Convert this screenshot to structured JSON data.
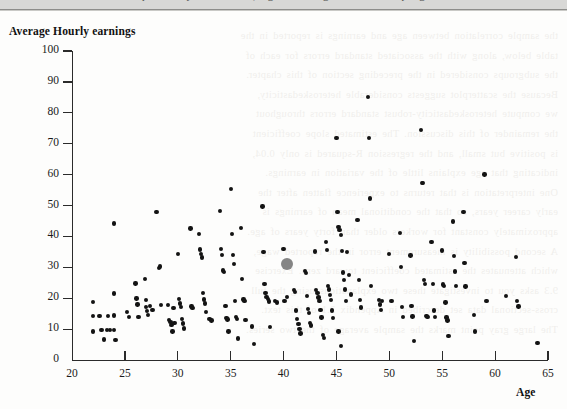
{
  "page": {
    "top_clipped_text": "probability distributions, regression diagnostics and sampling",
    "bleed_lines": [
      "the sample correlation between age and earnings is reported in the",
      "table below, along with the associated standard errors for each of",
      "the subgroups considered in the preceding section of this chapter.",
      "Because the scatterplot suggests considerable heteroskedasticity,",
      "we compute heteroskedasticity-robust standard errors throughout",
      "the remainder of this discussion. The estimated slope coefficient",
      "is positive but small, and the regression R-squared is only 0.04,",
      "indicating that age explains little of the variation in earnings.",
      "One interpretation is that returns to experience flatten after the",
      "early career years, so that the conditional mean of earnings is",
      "approximately constant for workers older than forty years of age.",
      "A second possibility is measurement error in the reported wage,",
      "which attenuates the estimated coefficient toward zero. Exercise",
      "9.3 asks you to investigate these two explanations using the full",
      "cross-sectional data set described in Appendix 3.1 of this text.",
      "The large gray point marks the sample average of the two series."
    ]
  },
  "chart_data": {
    "type": "scatter",
    "title": "",
    "xlabel": "Age",
    "ylabel": "Average Hourly earnings",
    "xlim": [
      20,
      65
    ],
    "ylim": [
      0,
      100
    ],
    "xticks": [
      20,
      25,
      30,
      35,
      40,
      45,
      50,
      55,
      60,
      65
    ],
    "yticks": [
      0,
      10,
      20,
      30,
      40,
      50,
      60,
      70,
      80,
      90,
      100
    ],
    "grid": false,
    "legend": false,
    "point_color": "#131313",
    "highlight_color": "#858585",
    "highlight_point": {
      "x": 40.3,
      "y": 31.0,
      "label": "sample mean"
    },
    "points": [
      [
        22.0,
        18.8
      ],
      [
        22.0,
        14.2
      ],
      [
        22.0,
        9.2
      ],
      [
        22.6,
        14.2
      ],
      [
        22.8,
        9.6
      ],
      [
        23.0,
        6.6
      ],
      [
        23.3,
        9.6
      ],
      [
        23.4,
        14.3
      ],
      [
        23.6,
        9.7
      ],
      [
        24.0,
        44.2
      ],
      [
        24.0,
        21.5
      ],
      [
        24.0,
        14.4
      ],
      [
        24.0,
        9.6
      ],
      [
        24.1,
        6.5
      ],
      [
        25.2,
        15.6
      ],
      [
        25.4,
        13.9
      ],
      [
        26.0,
        24.8
      ],
      [
        26.1,
        19.9
      ],
      [
        26.2,
        18.0
      ],
      [
        26.3,
        14.0
      ],
      [
        26.9,
        26.2
      ],
      [
        27.0,
        19.4
      ],
      [
        27.0,
        17.2
      ],
      [
        27.1,
        15.8
      ],
      [
        27.2,
        14.6
      ],
      [
        27.4,
        17.4
      ],
      [
        27.6,
        16.2
      ],
      [
        28.0,
        47.8
      ],
      [
        28.2,
        29.8
      ],
      [
        28.3,
        30.3
      ],
      [
        28.4,
        17.8
      ],
      [
        29.1,
        17.7
      ],
      [
        29.2,
        13.0
      ],
      [
        29.3,
        12.2
      ],
      [
        29.4,
        11.3
      ],
      [
        29.5,
        9.2
      ],
      [
        29.6,
        16.8
      ],
      [
        29.7,
        12.0
      ],
      [
        30.0,
        34.3
      ],
      [
        30.1,
        19.8
      ],
      [
        30.2,
        18.3
      ],
      [
        30.3,
        17.1
      ],
      [
        30.4,
        13.2
      ],
      [
        30.5,
        11.8
      ],
      [
        30.6,
        10.2
      ],
      [
        31.2,
        42.6
      ],
      [
        31.3,
        17.3
      ],
      [
        31.4,
        16.9
      ],
      [
        32.0,
        40.8
      ],
      [
        32.1,
        35.8
      ],
      [
        32.2,
        34.3
      ],
      [
        32.3,
        33.2
      ],
      [
        32.4,
        21.6
      ],
      [
        32.5,
        19.6
      ],
      [
        32.6,
        18.3
      ],
      [
        32.7,
        15.6
      ],
      [
        33.0,
        13.2
      ],
      [
        33.2,
        12.8
      ],
      [
        34.0,
        48.2
      ],
      [
        34.1,
        36.0
      ],
      [
        34.2,
        34.0
      ],
      [
        34.3,
        29.0
      ],
      [
        34.4,
        28.4
      ],
      [
        34.5,
        17.4
      ],
      [
        34.6,
        13.6
      ],
      [
        34.7,
        13.1
      ],
      [
        34.8,
        9.2
      ],
      [
        35.0,
        55.3
      ],
      [
        35.1,
        40.7
      ],
      [
        35.2,
        34.0
      ],
      [
        35.3,
        31.0
      ],
      [
        35.4,
        19.2
      ],
      [
        35.5,
        14.0
      ],
      [
        35.6,
        13.2
      ],
      [
        35.7,
        7.0
      ],
      [
        36.0,
        42.8
      ],
      [
        36.1,
        26.2
      ],
      [
        36.2,
        19.6
      ],
      [
        36.3,
        19.0
      ],
      [
        36.4,
        13.0
      ],
      [
        37.0,
        10.8
      ],
      [
        37.2,
        5.2
      ],
      [
        38.0,
        49.7
      ],
      [
        38.1,
        35.0
      ],
      [
        38.2,
        24.6
      ],
      [
        38.3,
        21.6
      ],
      [
        38.4,
        20.4
      ],
      [
        38.5,
        19.8
      ],
      [
        38.6,
        18.9
      ],
      [
        38.7,
        10.7
      ],
      [
        39.2,
        19.0
      ],
      [
        39.4,
        18.6
      ],
      [
        40.0,
        35.9
      ],
      [
        40.1,
        19.2
      ],
      [
        40.3,
        20.4
      ],
      [
        41.0,
        22.6
      ],
      [
        41.1,
        22.0
      ],
      [
        41.2,
        16.0
      ],
      [
        41.3,
        13.2
      ],
      [
        41.4,
        11.6
      ],
      [
        41.5,
        10.0
      ],
      [
        41.6,
        8.6
      ],
      [
        42.0,
        28.7
      ],
      [
        42.1,
        28.2
      ],
      [
        42.2,
        20.6
      ],
      [
        42.3,
        16.4
      ],
      [
        42.4,
        15.2
      ],
      [
        42.5,
        12.0
      ],
      [
        42.6,
        11.2
      ],
      [
        43.0,
        35.1
      ],
      [
        43.1,
        22.6
      ],
      [
        43.2,
        21.6
      ],
      [
        43.3,
        20.2
      ],
      [
        43.4,
        19.0
      ],
      [
        43.5,
        16.1
      ],
      [
        43.6,
        13.8
      ],
      [
        43.7,
        8.0
      ],
      [
        43.8,
        7.2
      ],
      [
        44.0,
        38.1
      ],
      [
        44.1,
        35.6
      ],
      [
        44.2,
        24.0
      ],
      [
        44.3,
        22.8
      ],
      [
        44.4,
        21.0
      ],
      [
        44.5,
        19.4
      ],
      [
        44.6,
        16.0
      ],
      [
        44.7,
        13.7
      ],
      [
        45.0,
        71.8
      ],
      [
        45.1,
        47.9
      ],
      [
        45.2,
        43.1
      ],
      [
        45.3,
        42.0
      ],
      [
        45.4,
        40.4
      ],
      [
        45.5,
        35.2
      ],
      [
        45.6,
        28.3
      ],
      [
        45.7,
        26.0
      ],
      [
        45.8,
        22.8
      ],
      [
        45.9,
        19.2
      ],
      [
        45.2,
        9.2
      ],
      [
        45.4,
        4.6
      ],
      [
        46.0,
        35.0
      ],
      [
        46.2,
        27.4
      ],
      [
        46.4,
        21.2
      ],
      [
        47.0,
        45.4
      ],
      [
        47.1,
        26.0
      ],
      [
        47.2,
        19.4
      ],
      [
        47.3,
        17.0
      ],
      [
        48.0,
        85.2
      ],
      [
        48.1,
        71.8
      ],
      [
        48.2,
        52.3
      ],
      [
        48.3,
        24.0
      ],
      [
        49.0,
        19.4
      ],
      [
        49.1,
        18.0
      ],
      [
        49.2,
        16.2
      ],
      [
        49.3,
        19.2
      ],
      [
        50.0,
        34.2
      ],
      [
        50.2,
        19.2
      ],
      [
        51.0,
        41.0
      ],
      [
        51.1,
        30.2
      ],
      [
        51.2,
        17.2
      ],
      [
        51.3,
        14.0
      ],
      [
        52.0,
        33.8
      ],
      [
        52.1,
        17.4
      ],
      [
        52.2,
        14.1
      ],
      [
        52.3,
        6.2
      ],
      [
        53.0,
        74.4
      ],
      [
        53.1,
        57.3
      ],
      [
        53.2,
        57.3
      ],
      [
        53.3,
        26.0
      ],
      [
        53.4,
        24.6
      ],
      [
        53.5,
        14.2
      ],
      [
        53.6,
        14.0
      ],
      [
        54.0,
        38.3
      ],
      [
        54.1,
        24.6
      ],
      [
        54.2,
        16.0
      ],
      [
        54.3,
        14.0
      ],
      [
        55.0,
        35.4
      ],
      [
        55.1,
        24.4
      ],
      [
        55.2,
        24.0
      ],
      [
        55.3,
        18.6
      ],
      [
        55.4,
        13.8
      ],
      [
        55.5,
        12.8
      ],
      [
        55.6,
        7.8
      ],
      [
        56.0,
        44.8
      ],
      [
        56.1,
        33.6
      ],
      [
        56.2,
        28.6
      ],
      [
        56.3,
        24.0
      ],
      [
        57.0,
        47.9
      ],
      [
        57.1,
        31.4
      ],
      [
        57.2,
        23.8
      ],
      [
        58.0,
        14.6
      ],
      [
        58.1,
        9.2
      ],
      [
        59.0,
        60.0
      ],
      [
        59.2,
        19.0
      ],
      [
        61.0,
        20.6
      ],
      [
        62.0,
        33.4
      ],
      [
        62.1,
        19.0
      ],
      [
        62.2,
        17.3
      ],
      [
        64.0,
        5.6
      ]
    ]
  }
}
